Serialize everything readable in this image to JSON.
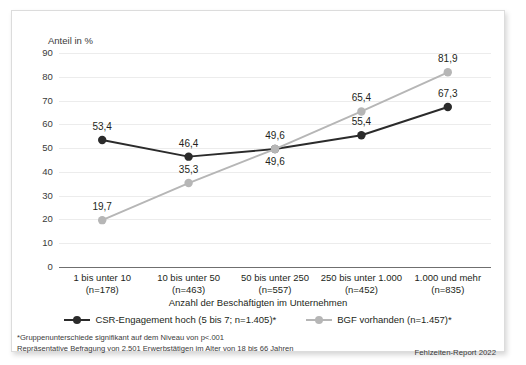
{
  "chart_data": {
    "type": "line",
    "title": "",
    "subtitle": "",
    "ylabel": "Anteil in %",
    "xlabel": "Anzahl der Beschäftigten im Unternehmen",
    "ylim": [
      0,
      90
    ],
    "yticks": [
      90,
      80,
      70,
      60,
      50,
      40,
      30,
      20,
      10,
      0
    ],
    "ytick_labels": [
      "90",
      "80",
      "70",
      "60",
      "50",
      "40",
      "30",
      "20",
      "10",
      "0"
    ],
    "grid": true,
    "legend_position": "bottom",
    "categories": [
      "1 bis unter 10",
      "10 bis unter 50",
      "50 bis unter 250",
      "250 bis unter 1.000",
      "1.000 und mehr"
    ],
    "category_counts": [
      "(n=178)",
      "(n=463)",
      "(n=557)",
      "(n=452)",
      "(n=835)"
    ],
    "series": [
      {
        "name": "CSR-Engagement hoch (5 bis 7; n=1.405)*",
        "color": "#2b2b2b",
        "values": [
          53.4,
          46.4,
          49.6,
          55.4,
          67.3
        ],
        "value_labels": [
          "53,4",
          "46,4",
          "49,6",
          "55,4",
          "67,3"
        ],
        "label_positions": [
          "above",
          "above",
          "below",
          "above",
          "above"
        ]
      },
      {
        "name": "BGF vorhanden (n=1.457)*",
        "color": "#b6b6b6",
        "values": [
          19.7,
          35.3,
          49.6,
          65.4,
          81.9
        ],
        "value_labels": [
          "19,7",
          "35,3",
          "49,6",
          "65,4",
          "81,9"
        ],
        "label_positions": [
          "above",
          "above",
          "above",
          "above",
          "above"
        ]
      }
    ],
    "annotations": [
      "*Gruppenunterschiede signifikant auf dem Niveau von p<.001",
      "Repräsentative Befragung von 2.501 Erwerbstätigen im Alter von 18 bis 66 Jahren"
    ],
    "source": "Fehlzeiten-Report 2022"
  },
  "footnotes": {
    "line1": "*Gruppenunterschiede signifikant auf dem Niveau von p<.001",
    "line2": "Repräsentative Befragung von 2.501 Erwerbstätigen im Alter von 18 bis 66 Jahren"
  },
  "source_credit": "Fehlzeiten-Report 2022",
  "colors": {
    "series_csr": "#2b2b2b",
    "series_bgf": "#b6b6b6",
    "gridline": "#ececec",
    "axis": "#6f6f6f",
    "text": "#231f20",
    "card_border": "#dcdcdc"
  }
}
